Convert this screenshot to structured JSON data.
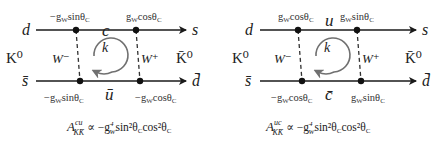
{
  "diagrams": [
    {
      "id": "cu",
      "top_left_quark": "d",
      "top_right_quark": "s",
      "bottom_left_quark": "s̄",
      "bottom_right_quark": "d̄",
      "left_meson": "K⁰",
      "right_meson": "K̄⁰",
      "top_internal_quark": "c",
      "bottom_internal_quark": "ū",
      "left_boson": "W⁻",
      "right_boson": "W⁺",
      "loop_momentum": "k",
      "couplings": {
        "top_left": "−g",
        "top_left_rest": "sinθ",
        "top_right": "g",
        "top_right_rest": "cosθ",
        "bottom_left": "−g",
        "bottom_left_rest": "sinθ",
        "bottom_right": "−g",
        "bottom_right_rest": "cosθ",
        "sub_w": "W",
        "sub_c": "C"
      },
      "formula": {
        "A": "A",
        "sup": "cu",
        "sub": "KK̄",
        "rest": "∝ −g",
        "g_sup": "4",
        "g_sub": "W",
        "trig": "sin²θ",
        "trig_sub": "C",
        "trig2": "cos²θ",
        "trig2_sub": "C"
      }
    },
    {
      "id": "uc",
      "top_left_quark": "d",
      "top_right_quark": "s",
      "bottom_left_quark": "s̄",
      "bottom_right_quark": "d̄",
      "left_meson": "K⁰",
      "right_meson": "K̄⁰",
      "top_internal_quark": "u",
      "bottom_internal_quark": "c̄",
      "left_boson": "W⁻",
      "right_boson": "W⁺",
      "loop_momentum": "k",
      "couplings": {
        "top_left": "g",
        "top_left_rest": "cosθ",
        "top_right": "g",
        "top_right_rest": "sinθ",
        "bottom_left": "−g",
        "bottom_left_rest": "cosθ",
        "bottom_right": "g",
        "bottom_right_rest": "sinθ",
        "sub_w": "W",
        "sub_c": "C"
      },
      "formula": {
        "A": "A",
        "sup": "uc",
        "sub": "KK̄",
        "rest": "∝ −g",
        "g_sup": "4",
        "g_sub": "W",
        "trig": "sin²θ",
        "trig_sub": "C",
        "trig2": "cos²θ",
        "trig2_sub": "C"
      }
    }
  ],
  "colors": {
    "line": "#1a1a1a",
    "loop_arrow": "#707070",
    "dashed": "#333333"
  }
}
